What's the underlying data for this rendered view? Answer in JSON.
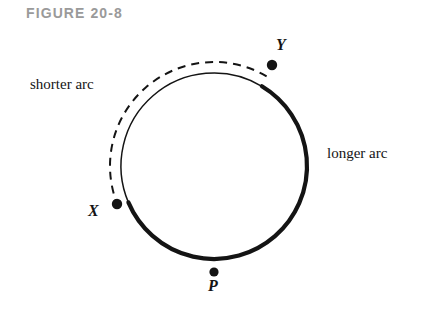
{
  "figure": {
    "caption": "FIGURE 20-8",
    "caption_color": "#9a9a9a",
    "background_color": "#ffffff",
    "stroke_color": "#141414"
  },
  "labels": {
    "shorter_arc": "shorter arc",
    "longer_arc": "longer arc",
    "point_x": "X",
    "point_y": "Y",
    "point_p": "P"
  },
  "chart_data": {
    "type": "diagram",
    "title": "FIGURE 20-8",
    "circle": {
      "center_x": 214,
      "center_y": 166,
      "radius": 93
    },
    "points": [
      {
        "name": "X",
        "x": 117,
        "y": 204,
        "angle_deg": 157,
        "label_offset_x": -29,
        "label_offset_y": -2
      },
      {
        "name": "Y",
        "x": 272,
        "y": 65,
        "angle_deg": -59,
        "label_offset_x": 4,
        "label_offset_y": -29
      },
      {
        "name": "P",
        "x": 214,
        "y": 272,
        "angle_deg": 90,
        "label_offset_x": -6,
        "label_offset_y": 5
      }
    ],
    "arcs": [
      {
        "name": "longer arc",
        "style": "thick-solid",
        "stroke_width": 4.2,
        "from": "X",
        "to": "Y",
        "direction": "clockwise-through-P",
        "label": "longer arc"
      },
      {
        "name": "shorter arc",
        "style": "thin-solid",
        "stroke_width": 1.5,
        "from": "X",
        "to": "Y",
        "direction": "counterclockwise-over-top",
        "label": "shorter arc"
      },
      {
        "name": "shorter arc highlight",
        "style": "dashed",
        "stroke_width": 2.0,
        "radius": 104,
        "from": "X",
        "to": "Y",
        "direction": "counterclockwise-over-top",
        "dash_pattern": "8 6"
      }
    ],
    "grid": false,
    "legend": null
  }
}
